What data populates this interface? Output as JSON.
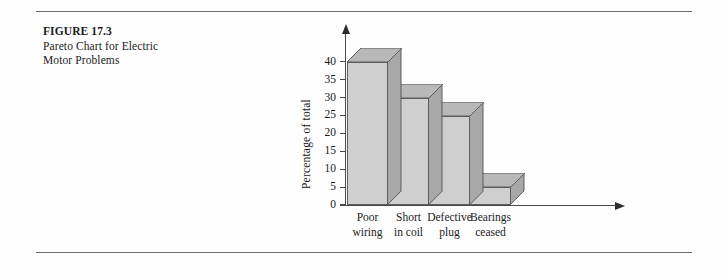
{
  "figure": {
    "number_label": "FIGURE 17.3",
    "caption_line1": "Pareto Chart for Electric",
    "caption_line2": "Motor Problems"
  },
  "chart_data": {
    "type": "bar",
    "title": "Pareto Chart for Electric Motor Problems",
    "xlabel": "",
    "ylabel": "Percentage of total",
    "categories": [
      "Poor wiring",
      "Short in coil",
      "Defective plug",
      "Bearings ceased"
    ],
    "category_lines": [
      [
        "Poor",
        "wiring"
      ],
      [
        "Short",
        "in coil"
      ],
      [
        "Defective",
        "plug"
      ],
      [
        "Bearings",
        "ceased"
      ]
    ],
    "values": [
      40,
      30,
      25,
      5
    ],
    "ylim": [
      0,
      45
    ],
    "yticks": [
      0,
      5,
      10,
      15,
      20,
      25,
      30,
      35,
      40
    ],
    "ytick_labels": [
      "0",
      "5",
      "10",
      "15",
      "20",
      "25",
      "30",
      "35",
      "40"
    ],
    "grid": false,
    "legend": false,
    "style": "3d-blocks",
    "colors": {
      "bar_front": "#cfcfcf",
      "bar_top": "#b8b8b8",
      "bar_side": "#a8a8a8",
      "outline": "#5c5c5c",
      "axis": "#4a4a4a",
      "rule": "#6d6f72"
    }
  }
}
